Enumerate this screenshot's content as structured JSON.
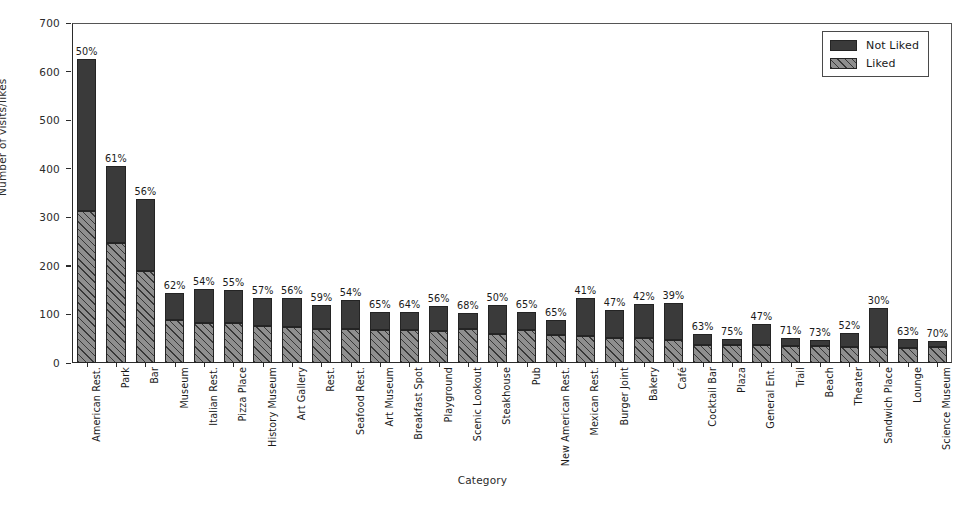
{
  "chart_data": {
    "type": "bar",
    "subtype": "stacked-bar",
    "title": "",
    "xlabel": "Category",
    "ylabel": "Number of visits/likes",
    "ylim": [
      0,
      700
    ],
    "yticks": [
      0,
      100,
      200,
      300,
      400,
      500,
      600,
      700
    ],
    "grid": false,
    "legend_position": "upper right",
    "legend": [
      "Not Liked",
      "Liked"
    ],
    "colors": {
      "not_liked": "#3a3a3a",
      "liked": "#8f8f8f",
      "axis": "#2b2b2b"
    },
    "annotation_note": "Percent label above each bar is the Liked share of the total.",
    "categories": [
      "American Rest.",
      "Park",
      "Bar",
      "Museum",
      "Italian Rest.",
      "Pizza Place",
      "History Museum",
      "Art Gallery",
      "Rest.",
      "Seafood Rest.",
      "Art Museum",
      "Breakfast Spot",
      "Playground",
      "Scenic Lookout",
      "Steakhouse",
      "Pub",
      "New American Rest.",
      "Mexican Rest.",
      "Burger Joint",
      "Bakery",
      "Café",
      "Cocktail Bar",
      "Plaza",
      "General Ent.",
      "Trail",
      "Beach",
      "Theater",
      "Sandwich Place",
      "Lounge",
      "Science Museum"
    ],
    "series": [
      {
        "name": "Liked",
        "values": [
          313,
          247,
          189,
          89,
          82,
          83,
          76,
          75,
          70,
          70,
          68,
          67,
          66,
          70,
          60,
          68,
          57,
          55,
          51,
          51,
          48,
          37,
          37,
          38,
          36,
          35,
          32,
          34,
          31,
          32
        ]
      },
      {
        "name": "Not Liked",
        "values": [
          312,
          158,
          148,
          55,
          70,
          68,
          57,
          59,
          49,
          60,
          37,
          38,
          52,
          33,
          60,
          37,
          31,
          79,
          58,
          70,
          75,
          22,
          12,
          43,
          15,
          13,
          30,
          79,
          18,
          14
        ]
      }
    ],
    "totals": [
      625,
      405,
      337,
      144,
      152,
      151,
      133,
      134,
      119,
      130,
      105,
      105,
      118,
      103,
      120,
      105,
      88,
      134,
      109,
      121,
      123,
      59,
      49,
      81,
      51,
      48,
      62,
      113,
      49,
      46
    ],
    "percent_labels": [
      "50%",
      "61%",
      "56%",
      "62%",
      "54%",
      "55%",
      "57%",
      "56%",
      "59%",
      "54%",
      "65%",
      "64%",
      "56%",
      "68%",
      "50%",
      "65%",
      "65%",
      "41%",
      "47%",
      "42%",
      "39%",
      "63%",
      "75%",
      "47%",
      "71%",
      "73%",
      "52%",
      "30%",
      "63%",
      "70%"
    ]
  },
  "legend": {
    "items": [
      {
        "label": "Not Liked",
        "swatch": "not-liked-swatch"
      },
      {
        "label": "Liked",
        "swatch": "liked-swatch"
      }
    ]
  }
}
